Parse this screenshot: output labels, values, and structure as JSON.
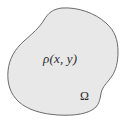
{
  "figure": {
    "type": "region-diagram",
    "caption_text": "",
    "background_color": "#ffffff",
    "region": {
      "name": "blob-region",
      "fill_color": "#e8e8e8",
      "stroke_color": "#6b6b6b",
      "stroke_width": 1,
      "shape_hint": "irregular closed convex-concave blob"
    },
    "labels": {
      "density": "ρ(x, y)",
      "domain": "Ω"
    },
    "label_color": "#2b2b2b"
  }
}
